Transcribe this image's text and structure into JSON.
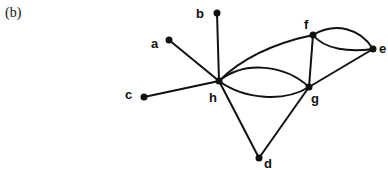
{
  "figure": {
    "panel_label": "(b)",
    "nodes": [
      {
        "id": "a",
        "label": "a"
      },
      {
        "id": "b",
        "label": "b"
      },
      {
        "id": "c",
        "label": "c"
      },
      {
        "id": "d",
        "label": "d"
      },
      {
        "id": "e",
        "label": "e"
      },
      {
        "id": "f",
        "label": "f"
      },
      {
        "id": "g",
        "label": "g"
      },
      {
        "id": "h",
        "label": "h"
      }
    ],
    "edges": [
      {
        "from": "a",
        "to": "h"
      },
      {
        "from": "b",
        "to": "h"
      },
      {
        "from": "c",
        "to": "h"
      },
      {
        "from": "h",
        "to": "d"
      },
      {
        "from": "d",
        "to": "g"
      },
      {
        "from": "h",
        "to": "f"
      },
      {
        "from": "h",
        "to": "g",
        "multiplicity": 2
      },
      {
        "from": "f",
        "to": "g"
      },
      {
        "from": "g",
        "to": "e"
      },
      {
        "from": "f",
        "to": "e",
        "multiplicity": 2
      }
    ]
  }
}
